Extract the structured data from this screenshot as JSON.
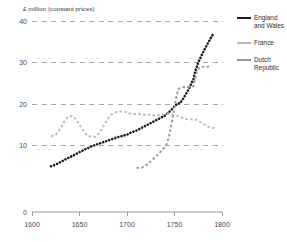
{
  "chart_data": {
    "type": "line",
    "title": "",
    "ylabel": "£ million (constant prices)",
    "xlabel": "",
    "xlim": [
      1600,
      1800
    ],
    "ylim": [
      0,
      40
    ],
    "grid": true,
    "legend_position": "right",
    "xticks": [
      "1600",
      "1650",
      "1700",
      "1750",
      "1800"
    ],
    "yticks": [
      "0",
      "10",
      "20",
      "30",
      "40"
    ],
    "series": [
      {
        "name": "England and Wales",
        "color": "#1c1c1c",
        "points": [
          [
            1620,
            5.0
          ],
          [
            1625,
            5.4
          ],
          [
            1630,
            6.0
          ],
          [
            1635,
            6.6
          ],
          [
            1640,
            7.2
          ],
          [
            1645,
            7.8
          ],
          [
            1650,
            8.4
          ],
          [
            1655,
            9.0
          ],
          [
            1660,
            9.5
          ],
          [
            1665,
            10.0
          ],
          [
            1670,
            10.4
          ],
          [
            1675,
            10.8
          ],
          [
            1680,
            11.2
          ],
          [
            1685,
            11.6
          ],
          [
            1690,
            12.0
          ],
          [
            1695,
            12.3
          ],
          [
            1700,
            12.6
          ],
          [
            1705,
            13.2
          ],
          [
            1710,
            13.6
          ],
          [
            1715,
            14.2
          ],
          [
            1720,
            14.8
          ],
          [
            1725,
            15.4
          ],
          [
            1730,
            16.0
          ],
          [
            1735,
            16.6
          ],
          [
            1740,
            17.2
          ],
          [
            1745,
            18.2
          ],
          [
            1750,
            19.4
          ],
          [
            1753,
            20.1
          ],
          [
            1756,
            20.2
          ],
          [
            1760,
            21.6
          ],
          [
            1765,
            23.6
          ],
          [
            1770,
            26.0
          ],
          [
            1772,
            28.0
          ],
          [
            1775,
            30.0
          ],
          [
            1780,
            32.4
          ],
          [
            1785,
            34.6
          ],
          [
            1790,
            36.6
          ]
        ]
      },
      {
        "name": "France",
        "color": "#b9b9b9",
        "points": [
          [
            1620,
            12.2
          ],
          [
            1625,
            12.6
          ],
          [
            1630,
            14.0
          ],
          [
            1634,
            15.8
          ],
          [
            1638,
            17.0
          ],
          [
            1642,
            17.1
          ],
          [
            1646,
            16.4
          ],
          [
            1650,
            15.0
          ],
          [
            1654,
            13.6
          ],
          [
            1658,
            12.4
          ],
          [
            1663,
            12.1
          ],
          [
            1667,
            12.1
          ],
          [
            1671,
            13.0
          ],
          [
            1675,
            14.6
          ],
          [
            1679,
            16.2
          ],
          [
            1683,
            17.4
          ],
          [
            1688,
            18.0
          ],
          [
            1693,
            18.2
          ],
          [
            1697,
            18.2
          ],
          [
            1701,
            17.8
          ],
          [
            1706,
            17.6
          ],
          [
            1712,
            17.6
          ],
          [
            1718,
            17.4
          ],
          [
            1724,
            17.4
          ],
          [
            1730,
            17.2
          ],
          [
            1736,
            17.4
          ],
          [
            1742,
            17.6
          ],
          [
            1748,
            17.4
          ],
          [
            1752,
            17.2
          ],
          [
            1757,
            16.8
          ],
          [
            1762,
            16.4
          ],
          [
            1768,
            16.3
          ],
          [
            1773,
            16.2
          ],
          [
            1778,
            15.6
          ],
          [
            1783,
            14.8
          ],
          [
            1788,
            14.3
          ],
          [
            1792,
            14.2
          ]
        ]
      },
      {
        "name": "Dutch Republic",
        "color": "#989898",
        "points": [
          [
            1710,
            4.6
          ],
          [
            1715,
            4.6
          ],
          [
            1719,
            5.0
          ],
          [
            1723,
            5.8
          ],
          [
            1727,
            6.6
          ],
          [
            1731,
            7.4
          ],
          [
            1735,
            8.4
          ],
          [
            1739,
            9.4
          ],
          [
            1742,
            10.4
          ],
          [
            1745,
            13.0
          ],
          [
            1748,
            16.4
          ],
          [
            1750,
            19.2
          ],
          [
            1752,
            21.8
          ],
          [
            1754,
            23.6
          ],
          [
            1757,
            24.0
          ],
          [
            1761,
            24.1
          ],
          [
            1765,
            24.1
          ],
          [
            1768,
            24.2
          ],
          [
            1770,
            24.3
          ],
          [
            1772,
            26.4
          ],
          [
            1774,
            28.2
          ],
          [
            1777,
            28.9
          ],
          [
            1781,
            29.0
          ],
          [
            1785,
            29.0
          ],
          [
            1789,
            29.0
          ]
        ]
      }
    ]
  },
  "legend": {
    "items": [
      {
        "label": "England and Wales",
        "color": "#1c1c1c"
      },
      {
        "label": "France",
        "color": "#b9b9b9"
      },
      {
        "label": "Dutch Republic",
        "color": "#989898"
      }
    ]
  }
}
